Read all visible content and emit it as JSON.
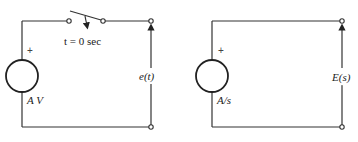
{
  "left_circuit": {
    "source_polarity": "+",
    "source_label": "A V",
    "switch_label": "t = 0 sec",
    "output_label": "e(t)"
  },
  "right_circuit": {
    "source_polarity": "+",
    "source_label": "A/s",
    "output_label": "E(s)"
  }
}
